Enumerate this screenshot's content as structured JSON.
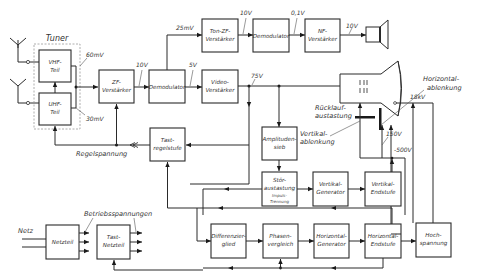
{
  "diagram": {
    "tuner_label": "Tuner",
    "blocks": {
      "vhf": [
        "VHF-",
        "Teil"
      ],
      "uhf": [
        "UHF-",
        "Teil"
      ],
      "zf": [
        "ZF-",
        "Verstärker"
      ],
      "demod1": [
        "Demodulator"
      ],
      "ton_zf": [
        "Ton-ZF-",
        "Verstärker"
      ],
      "demod2": [
        "Demodulator"
      ],
      "nf": [
        "NF-",
        "Verstärker"
      ],
      "video": [
        "Video-",
        "Verstärker"
      ],
      "tast_regel": [
        "Tast-",
        "regelstufe"
      ],
      "amplitudensieb": [
        "Amplituden-",
        "sieb"
      ],
      "stoer": [
        "Stör-",
        "austastung"
      ],
      "stoer_sub": [
        "Impuls-",
        "Trennung"
      ],
      "vert_gen": [
        "Vertikal-",
        "Generator"
      ],
      "vert_end": [
        "Vertikal-",
        "Endstufe"
      ],
      "netzteil": [
        "Netzteil"
      ],
      "tast_netz": [
        "Tast-",
        "Netzteil"
      ],
      "diff": [
        "Differenzier-",
        "glied"
      ],
      "phase": [
        "Phasen-",
        "vergleich"
      ],
      "hor_gen": [
        "Horizontal-",
        "Generator"
      ],
      "hor_end": [
        "Horizontal-",
        "Endstufe"
      ],
      "hoch": [
        "Hoch-",
        "spannung"
      ]
    },
    "voltages": {
      "v60mV": "60mV",
      "v30mV": "30mV",
      "v10V_zf": "10V",
      "v25mV": "25mV",
      "v10V_ton": "10V",
      "v01V": "0,1V",
      "v10V_nf": "10V",
      "v5V": "5V",
      "v75V": "75V",
      "v18kV": "18kV",
      "v150V": "150V",
      "v500V": "-500V"
    },
    "labels": {
      "regelspannung": "Regelspannung",
      "ruecklauf": [
        "Rücklauf-",
        "austastung"
      ],
      "vertikal_ablenkung": [
        "Vertikal-",
        "ablenkung"
      ],
      "horizontal_ablenkung": [
        "Horizontal-",
        "ablenkung"
      ],
      "betriebsspannungen": "Betriebsspannungen",
      "netz": "Netz"
    }
  }
}
